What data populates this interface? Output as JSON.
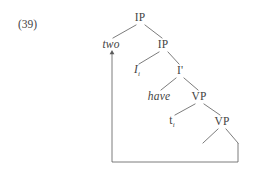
{
  "figure": {
    "example_number": "(39)",
    "ink_color": "#434343",
    "line_color": "#5a5a5a",
    "background_color": "#ffffff"
  },
  "tree": {
    "nodes": [
      {
        "id": "ip-root",
        "label": "IP",
        "style": "roman",
        "subscript": "",
        "x": 140,
        "y": 18
      },
      {
        "id": "two",
        "label": "two",
        "style": "italic",
        "subscript": "",
        "x": 111,
        "y": 45
      },
      {
        "id": "ip-lower",
        "label": "IP",
        "style": "roman",
        "subscript": "",
        "x": 163,
        "y": 45
      },
      {
        "id": "i-head",
        "label": "I",
        "style": "italic",
        "subscript": "i",
        "x": 137,
        "y": 71
      },
      {
        "id": "i-bar",
        "label": "I",
        "style": "roman",
        "subscript": "",
        "prime": "'",
        "x": 180,
        "y": 71
      },
      {
        "id": "have",
        "label": "have",
        "style": "italic",
        "subscript": "",
        "x": 159,
        "y": 97
      },
      {
        "id": "vp-upper",
        "label": "VP",
        "style": "roman",
        "subscript": "",
        "x": 199,
        "y": 97
      },
      {
        "id": "trace",
        "label": "t",
        "style": "roman",
        "subscript": "i",
        "x": 172,
        "y": 122
      },
      {
        "id": "vp-lower",
        "label": "VP",
        "style": "roman",
        "subscript": "",
        "x": 222,
        "y": 122
      }
    ],
    "branches": [
      {
        "from": "ip-root",
        "to": "two",
        "x1": 136,
        "y1": 25,
        "x2": 113,
        "y2": 38
      },
      {
        "from": "ip-root",
        "to": "ip-lower",
        "x1": 145,
        "y1": 25,
        "x2": 162,
        "y2": 38
      },
      {
        "from": "ip-lower",
        "to": "i-head",
        "x1": 159,
        "y1": 52,
        "x2": 139,
        "y2": 64
      },
      {
        "from": "ip-lower",
        "to": "i-bar",
        "x1": 168,
        "y1": 52,
        "x2": 179,
        "y2": 64
      },
      {
        "from": "i-bar",
        "to": "have",
        "x1": 176,
        "y1": 78,
        "x2": 161,
        "y2": 90
      },
      {
        "from": "i-bar",
        "to": "vp-upper",
        "x1": 184,
        "y1": 78,
        "x2": 198,
        "y2": 90
      },
      {
        "from": "vp-upper",
        "to": "trace",
        "x1": 195,
        "y1": 104,
        "x2": 175,
        "y2": 115
      },
      {
        "from": "vp-upper",
        "to": "vp-lower",
        "x1": 204,
        "y1": 104,
        "x2": 220,
        "y2": 115
      },
      {
        "from": "vp-lower",
        "to": "leaf-left",
        "x1": 218,
        "y1": 129,
        "x2": 203,
        "y2": 143
      },
      {
        "from": "vp-lower",
        "to": "leaf-right",
        "x1": 226,
        "y1": 129,
        "x2": 238,
        "y2": 143
      }
    ],
    "movement_arrow": {
      "description": "movement line from lowest right VP leaf back up to two",
      "path": "M 238 143 L 238 162 L 112 162 L 112 52",
      "arrowhead_at": {
        "x": 112,
        "y": 50
      },
      "arrowhead_direction": "up"
    }
  }
}
